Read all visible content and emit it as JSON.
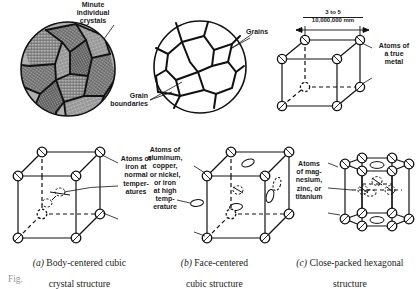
{
  "figure": {
    "title_fragment": "Fig.",
    "panels": [
      {
        "id": "panel-a",
        "caption_marker": "(a)",
        "caption_line1": " Body-centered cubic",
        "caption_line2": "crystal structure",
        "callout": "Atoms of\niron at\nnormal\ntemper-\natures"
      },
      {
        "id": "panel-b",
        "caption_marker": "(b)",
        "caption_line1": " Face-centered",
        "caption_line2": "cubic structure",
        "callout": "Atoms of\naluminum,\ncopper,\nor nickel,\nor iron\nat high\ntemp-\nerature"
      },
      {
        "id": "panel-c",
        "caption_marker": "(c)",
        "caption_line1": " Close-packed hexagonal",
        "caption_line2": "structure",
        "callout": "Atoms\nof mag-\nnesium,\nzinc, or\ntitanium"
      }
    ],
    "micrograph_left": {
      "label_crystals": "Minute\nindividual\ncrystals"
    },
    "micrograph_right": {
      "label_grains": "Grains",
      "label_boundaries": "Grain\nboundaries"
    },
    "unitcell_top": {
      "dimension_numerator": "3 to 5",
      "dimension_denominator": "10,000,000 mm",
      "callout": "Atoms of\na true\nmetal"
    },
    "colors": {
      "ink": "#1a1a1a",
      "grain_fill": "#9a9a9a",
      "paper": "#ffffff"
    }
  }
}
